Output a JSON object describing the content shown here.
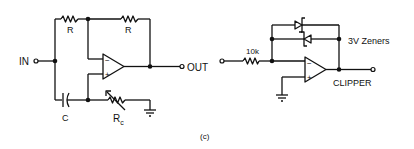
{
  "figure_label": "(c)",
  "left_circuit": {
    "name": "all-pass filter / phase shifter",
    "input_label": "IN",
    "output_label": "OUT",
    "resistor_top_left_label": "R",
    "resistor_top_right_label": "R",
    "capacitor_label": "C",
    "variable_resistor_label": "R",
    "variable_resistor_subscript": "c",
    "opamp_minus": "−",
    "opamp_plus": "+"
  },
  "right_circuit": {
    "name": "clipper",
    "input_resistor_label": "10k",
    "zener_label": "3V Zeners",
    "title_label": "CLIPPER",
    "opamp_minus": "−",
    "opamp_plus": "+"
  },
  "colors": {
    "ink": "#111111",
    "background": "#ffffff"
  }
}
